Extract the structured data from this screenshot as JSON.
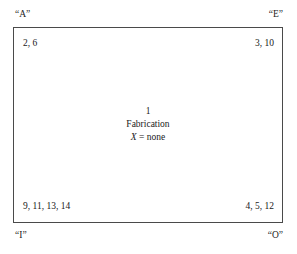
{
  "diagram": {
    "type": "idef0-function-box",
    "corner_labels": {
      "top_left": "“A”",
      "top_right": "“E”",
      "bottom_left": "“I”",
      "bottom_right": "“O”"
    },
    "arrow_refs": {
      "top_left": "2, 6",
      "top_right": "3, 10",
      "bottom_left": "9, 11, 13, 14",
      "bottom_right": "4, 5, 12"
    },
    "box": {
      "node_number": "1",
      "activity_name": "Fabrication",
      "mechanism_symbol": "X",
      "mechanism_assignment": " = none"
    },
    "colors": {
      "border": "#4a4a4a",
      "text": "#1a1a1a",
      "background": "#ffffff"
    }
  }
}
